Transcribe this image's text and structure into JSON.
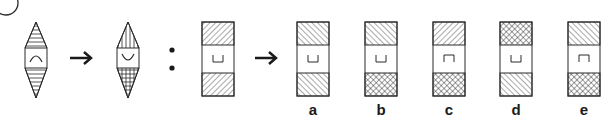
{
  "question": {
    "number_label": "10",
    "analogy_left": {
      "from": {
        "shape": "hexagon-diamond",
        "top_fill": "horizontal-lines",
        "bottom_fill": "horizontal-lines",
        "center_symbol": "arc-up (∩)"
      },
      "to": {
        "shape": "hexagon-diamond",
        "top_fill": "vertical-lines",
        "bottom_fill": "grid",
        "center_symbol": "arc-down (∪)"
      }
    },
    "separator": ":",
    "analogy_right_given": {
      "shape": "rectangle",
      "top_fill": "forward-diagonal",
      "bottom_fill": "forward-diagonal",
      "center_symbol": "⊔"
    },
    "arrow_symbol": "→"
  },
  "options": [
    {
      "label": "a",
      "top_fill": "back-diagonal",
      "bottom_fill": "back-diagonal",
      "center_symbol": "⊔"
    },
    {
      "label": "b",
      "top_fill": "back-diagonal",
      "bottom_fill": "crosshatch",
      "center_symbol": "⊔"
    },
    {
      "label": "c",
      "top_fill": "forward-diagonal",
      "bottom_fill": "crosshatch",
      "center_symbol": "⊓"
    },
    {
      "label": "d",
      "top_fill": "crosshatch",
      "bottom_fill": "back-diagonal",
      "center_symbol": "⊔"
    },
    {
      "label": "e",
      "top_fill": "back-diagonal",
      "bottom_fill": "crosshatch",
      "center_symbol": "⊓"
    }
  ],
  "colors": {
    "stroke": "#2a2a2a",
    "background": "#ffffff"
  }
}
